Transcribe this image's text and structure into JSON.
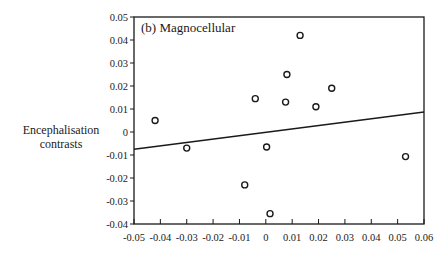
{
  "chart_data": {
    "type": "scatter",
    "title": "(b) Magnocellular",
    "xlabel": "",
    "ylabel": "Encephalisation contrasts",
    "ylabel_lines": [
      "Encephalisation",
      "contrasts"
    ],
    "xlim": [
      -0.05,
      0.06
    ],
    "ylim": [
      -0.04,
      0.05
    ],
    "x_ticks": [
      -0.05,
      -0.04,
      -0.03,
      -0.02,
      -0.01,
      0,
      0.01,
      0.02,
      0.03,
      0.04,
      0.05,
      0.06
    ],
    "x_tick_labels": [
      "-0.05",
      "-0.04",
      "-0.03",
      "-0.02",
      "-0.01",
      "0",
      "0.01",
      "0.02",
      "0.03",
      "0.04",
      "0.05",
      "0.06"
    ],
    "y_ticks": [
      0.05,
      0.04,
      0.03,
      0.02,
      0.01,
      0,
      -0.01,
      -0.02,
      -0.03,
      -0.04
    ],
    "y_tick_labels": [
      "0.05",
      "0.04",
      "0.03",
      "0.02",
      "0.01",
      "0",
      "-0.01",
      "-0.02",
      "-0.03",
      "-0.04"
    ],
    "grid": false,
    "legend": null,
    "series": [
      {
        "name": "contrasts",
        "marker": "open-circle",
        "points": [
          {
            "x": -0.042,
            "y": 0.005
          },
          {
            "x": -0.03,
            "y": -0.007
          },
          {
            "x": -0.004,
            "y": 0.0145
          },
          {
            "x": -0.008,
            "y": -0.023
          },
          {
            "x": 0.0003,
            "y": -0.0065
          },
          {
            "x": 0.0016,
            "y": -0.0355
          },
          {
            "x": 0.0075,
            "y": 0.013
          },
          {
            "x": 0.008,
            "y": 0.025
          },
          {
            "x": 0.013,
            "y": 0.042
          },
          {
            "x": 0.019,
            "y": 0.011
          },
          {
            "x": 0.025,
            "y": 0.019
          },
          {
            "x": 0.053,
            "y": -0.0107
          }
        ]
      }
    ],
    "regression_line": {
      "x": [
        -0.05,
        0.06
      ],
      "y": [
        -0.0075,
        0.0087
      ]
    }
  }
}
